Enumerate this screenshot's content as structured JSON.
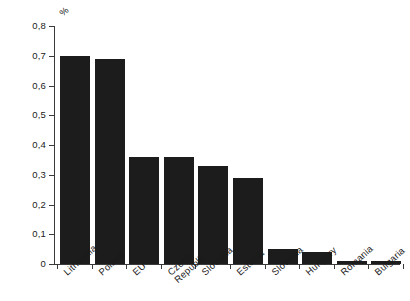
{
  "chart_data": {
    "type": "bar",
    "title": "",
    "subtitle": "",
    "xlabel": "",
    "ylabel": "%",
    "unit": "%",
    "categories": [
      "Lithuania",
      "Poland",
      "EU",
      "Czech\nRepublic",
      "Slovakia",
      "Estonia",
      "Slovenia",
      "Hungary",
      "Romania",
      "Bulgaria"
    ],
    "values": [
      0.7,
      0.69,
      0.36,
      0.36,
      0.33,
      0.29,
      0.05,
      0.04,
      0.01,
      0.01
    ],
    "series": [
      {
        "name": "",
        "values": [
          0.7,
          0.69,
          0.36,
          0.36,
          0.33,
          0.29,
          0.05,
          0.04,
          0.01,
          0.01
        ]
      }
    ],
    "ylim": [
      0,
      0.8
    ],
    "ytick_values": [
      0,
      0.1,
      0.2,
      0.3,
      0.4,
      0.5,
      0.6,
      0.7,
      0.8
    ],
    "ytick_labels": [
      "0",
      "0,1",
      "0,2",
      "0,3",
      "0,4",
      "0,5",
      "0,6",
      "0,7",
      "0,8"
    ],
    "grid": false,
    "legend": false,
    "legend_position": "none",
    "bar_color": "#1c1c1c",
    "axis_color": "#3a3a3a",
    "background_color": "#ffffff",
    "decimal_separator": ",",
    "label_rotation_deg": -42
  }
}
